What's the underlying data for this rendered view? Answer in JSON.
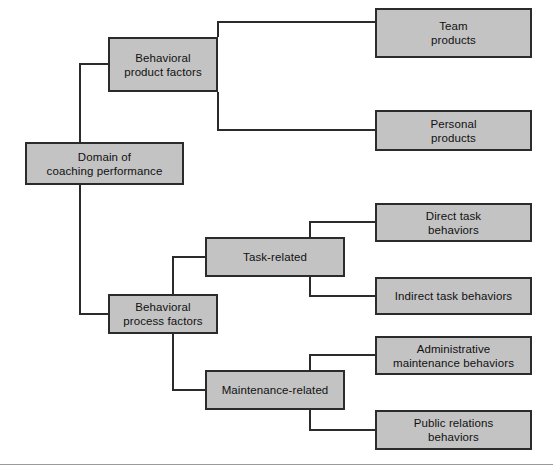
{
  "diagram": {
    "title_root": "Domain of\ncoaching performance",
    "nodes": [
      {
        "id": "root",
        "label": "Domain of\ncoaching performance"
      },
      {
        "id": "behavioral-product",
        "label": "Behavioral\nproduct factors"
      },
      {
        "id": "team-products",
        "label": "Team\nproducts"
      },
      {
        "id": "personal-products",
        "label": "Personal\nproducts"
      },
      {
        "id": "behavioral-process",
        "label": "Behavioral\nprocess factors"
      },
      {
        "id": "task-related",
        "label": "Task-related"
      },
      {
        "id": "direct-task",
        "label": "Direct task\nbehaviors"
      },
      {
        "id": "indirect-task",
        "label": "Indirect task behaviors"
      },
      {
        "id": "maintenance-related",
        "label": "Maintenance-related"
      },
      {
        "id": "administrative",
        "label": "Administrative\nmaintenance behaviors"
      },
      {
        "id": "public-relations",
        "label": "Public relations\nbehaviors"
      }
    ],
    "colors": {
      "node_fill": "#c3c3c3",
      "node_border": "#2b2b2b",
      "connector": "#2b2b2b",
      "rule": "#9a9a9a",
      "background": "#ffffff"
    }
  }
}
